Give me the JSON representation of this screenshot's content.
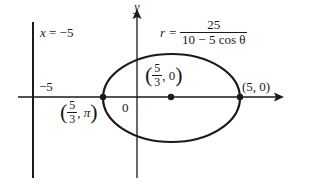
{
  "diagram": {
    "type": "polar conic (ellipse) graph",
    "equation": {
      "lhs": "r =",
      "numerator": "25",
      "denominator": "10 − 5 cos θ"
    },
    "directrix": {
      "label_lhs": "x",
      "label_rhs": "= −5",
      "tick_label": "−5"
    },
    "axes": {
      "y_label": "y",
      "origin_label": "0"
    },
    "points": [
      {
        "name": "left-vertex",
        "frac_num": "5",
        "frac_den": "3",
        "second": "π",
        "display": "(5/3, π)"
      },
      {
        "name": "focus-center",
        "frac_num": "5",
        "frac_den": "3",
        "second": "0",
        "display": "(5/3, 0)"
      },
      {
        "name": "right-vertex",
        "display": "(5, 0)"
      }
    ],
    "colors": {
      "stroke": "#1a1a1a",
      "background": "#ffffff"
    }
  }
}
